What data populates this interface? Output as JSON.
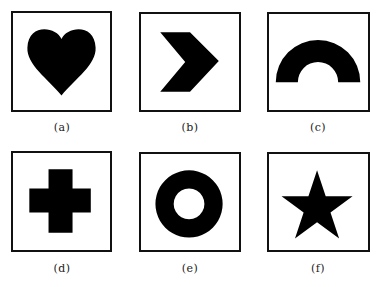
{
  "figure": {
    "colors": {
      "shape_fill": "#000000",
      "border": "#111111",
      "background": "#ffffff"
    },
    "panels": [
      {
        "id": "a",
        "label": "(a)",
        "shape": "heart-icon"
      },
      {
        "id": "b",
        "label": "(b)",
        "shape": "chevron-right-icon"
      },
      {
        "id": "c",
        "label": "(c)",
        "shape": "half-ring-arch-icon"
      },
      {
        "id": "d",
        "label": "(d)",
        "shape": "cross-plus-icon"
      },
      {
        "id": "e",
        "label": "(e)",
        "shape": "ring-icon"
      },
      {
        "id": "f",
        "label": "(f)",
        "shape": "star-icon"
      }
    ]
  }
}
